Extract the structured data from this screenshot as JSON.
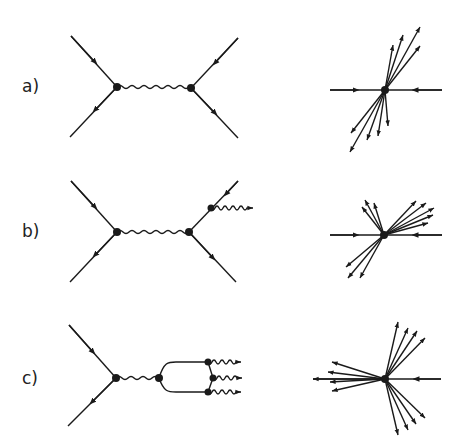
{
  "panels": [
    {
      "label": "a)",
      "description": "qq̄ annihilation via photon exchange, two-jet event"
    },
    {
      "label": "b)",
      "description": "with hard gluon bremsstrahlung, three-jet event"
    },
    {
      "label": "c)",
      "description": "quarkonium decay to three gluons, three-jet event"
    }
  ],
  "colors": {
    "ink": "#1a1a1a",
    "background": "#ffffff"
  }
}
